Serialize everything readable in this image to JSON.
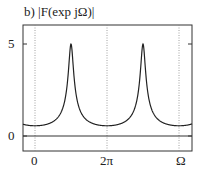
{
  "chart_data": {
    "type": "line",
    "title": "b) |F(exp jΩ)|",
    "xlabel": "Ω",
    "ylabel": "",
    "x_ticks": [
      {
        "label": "0",
        "value": 0
      },
      {
        "label": "2π",
        "value": 6.2832
      },
      {
        "label": "Ω",
        "value": 12.5664
      }
    ],
    "y_ticks": [
      {
        "label": "0",
        "value": 0
      },
      {
        "label": "5",
        "value": 5
      }
    ],
    "xlim": [
      -0.97,
      14.5
    ],
    "ylim": [
      -0.8,
      5.9
    ],
    "grid": {
      "vertical_dotted_at": [
        0,
        6.2832,
        12.5664
      ]
    },
    "zero_line": true,
    "series": [
      {
        "name": "|F(exp jΩ)|",
        "formula": "1/sqrt(1 + 0.64 - 1.6*cos(Ω - π))",
        "peaks": [
          {
            "x": 3.1416,
            "y": 5
          },
          {
            "x": 9.4248,
            "y": 5
          }
        ],
        "minimum": 0.556,
        "x": [
          -0.97,
          0,
          1.0,
          2.0,
          2.6,
          2.9,
          3.1416,
          3.4,
          3.7,
          4.3,
          5.3,
          6.2832,
          7.3,
          8.3,
          8.9,
          9.2,
          9.4248,
          9.7,
          10.0,
          10.6,
          11.6,
          12.5664,
          14.5
        ],
        "y": [
          0.58,
          0.556,
          0.6,
          0.95,
          1.8,
          3.3,
          5.0,
          3.4,
          1.9,
          1.0,
          0.64,
          0.556,
          0.62,
          0.93,
          1.8,
          3.6,
          5.0,
          3.3,
          1.9,
          1.0,
          0.63,
          0.556,
          0.7
        ]
      }
    ]
  },
  "labels": {
    "title": "b) |F(exp jΩ)|",
    "y5": "5",
    "y0": "0",
    "x0": "0",
    "x2pi": "2π",
    "xOmega": "Ω"
  }
}
